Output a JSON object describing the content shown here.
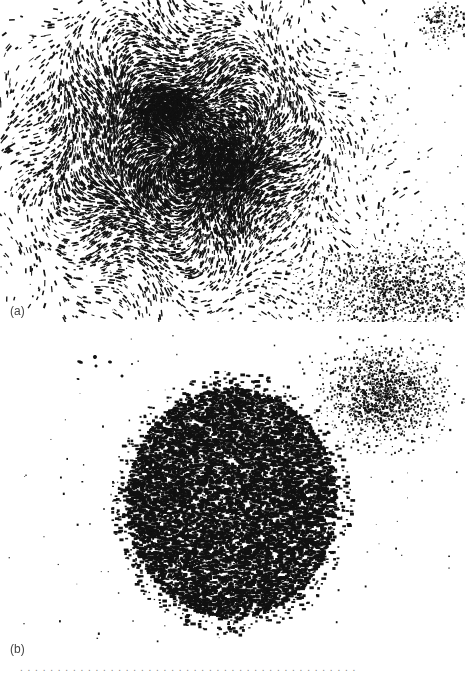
{
  "figure": {
    "panels": [
      {
        "id": "a",
        "label": "(a)",
        "description": "Large irregular colony of elongated, aligned cells forming swirling patterns",
        "ink_color": "#111111",
        "clusters": [
          {
            "cx": 175,
            "cy": 150,
            "rx": 150,
            "ry": 140,
            "count": 9000,
            "style": "swirl",
            "size": 2.2
          },
          {
            "cx": 165,
            "cy": 110,
            "rx": 40,
            "ry": 25,
            "count": 900,
            "style": "swirl",
            "size": 2.0
          },
          {
            "cx": 230,
            "cy": 170,
            "rx": 50,
            "ry": 45,
            "count": 1400,
            "style": "swirl",
            "size": 2.2
          },
          {
            "cx": 400,
            "cy": 290,
            "rx": 90,
            "ry": 45,
            "count": 1500,
            "style": "speckle",
            "size": 1.6
          },
          {
            "cx": 445,
            "cy": 20,
            "rx": 25,
            "ry": 25,
            "count": 150,
            "style": "speckle",
            "size": 1.6
          },
          {
            "cx": 240,
            "cy": 160,
            "rx": 240,
            "ry": 170,
            "count": 900,
            "style": "speckle",
            "size": 1.3
          }
        ]
      },
      {
        "id": "b",
        "label": "(b)",
        "description": "Compact round colony of small cells plus a smaller diffuse colony at upper right",
        "ink_color": "#111111",
        "clusters": [
          {
            "cx": 230,
            "cy": 168,
            "rx": 105,
            "ry": 115,
            "count": 11000,
            "style": "dense",
            "size": 2.0
          },
          {
            "cx": 385,
            "cy": 60,
            "rx": 55,
            "ry": 45,
            "count": 1500,
            "style": "speckle",
            "size": 1.6
          },
          {
            "cx": 240,
            "cy": 160,
            "rx": 240,
            "ry": 170,
            "count": 180,
            "style": "speckle",
            "size": 1.4
          }
        ],
        "blobs": [
          {
            "x": 80,
            "y": 28,
            "w": 6,
            "h": 3
          },
          {
            "x": 95,
            "y": 23,
            "w": 4,
            "h": 4
          },
          {
            "x": 96,
            "y": 32,
            "w": 3,
            "h": 3
          },
          {
            "x": 110,
            "y": 28,
            "w": 4,
            "h": 3
          },
          {
            "x": 78,
            "y": 45,
            "w": 3,
            "h": 2
          },
          {
            "x": 122,
            "y": 42,
            "w": 3,
            "h": 3
          },
          {
            "x": 132,
            "y": 30,
            "w": 2,
            "h": 2
          }
        ]
      }
    ],
    "caption_fragment": ". . . . . . . . . . . . . . . . . . . . . . . . . . . . . . . . . . . . . . . . . . . . ."
  }
}
